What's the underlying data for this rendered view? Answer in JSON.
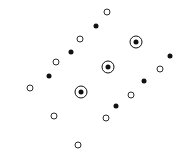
{
  "plot": {
    "width": 183,
    "height": 161,
    "background_color": "#ffffff",
    "marker_color": "#111111",
    "marker_types": {
      "filled": "filled-dot",
      "open": "open-circle",
      "target": "concentric-circle"
    }
  },
  "chart_data": {
    "type": "scatter",
    "title": "",
    "xlabel": "",
    "ylabel": "",
    "xlim": [
      0,
      183
    ],
    "ylim": [
      0,
      161
    ],
    "grid": false,
    "legend": null,
    "axes_visible": false,
    "tick_labels": [],
    "series": [
      {
        "name": "open-circle",
        "marker": "open",
        "color": "#2a2a2a",
        "points": [
          {
            "x": 107,
            "y": 12
          },
          {
            "x": 80,
            "y": 39
          },
          {
            "x": 56,
            "y": 62
          },
          {
            "x": 30,
            "y": 88
          },
          {
            "x": 160,
            "y": 69
          },
          {
            "x": 131,
            "y": 95
          },
          {
            "x": 106,
            "y": 118
          },
          {
            "x": 54,
            "y": 116
          },
          {
            "x": 78,
            "y": 145
          }
        ]
      },
      {
        "name": "filled-dot",
        "marker": "filled",
        "color": "#111111",
        "points": [
          {
            "x": 96,
            "y": 26
          },
          {
            "x": 71,
            "y": 52
          },
          {
            "x": 49,
            "y": 76
          },
          {
            "x": 170,
            "y": 56
          },
          {
            "x": 144,
            "y": 81
          },
          {
            "x": 116,
            "y": 106
          }
        ]
      },
      {
        "name": "concentric-circle",
        "marker": "target",
        "color": "#111111",
        "points": [
          {
            "x": 136,
            "y": 42
          },
          {
            "x": 108,
            "y": 67
          },
          {
            "x": 81,
            "y": 92
          }
        ]
      }
    ]
  }
}
